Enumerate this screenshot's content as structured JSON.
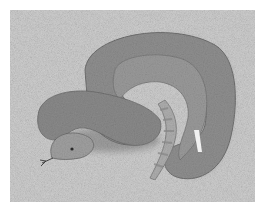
{
  "image": {
    "subject": "coiled snake on sand",
    "style": "grayscale photograph",
    "colors": {
      "border": "#ffffff",
      "sand": "#c9c9c9",
      "snake_body": "#8d8d8d",
      "snake_shadow": "#5e5e5e",
      "tail_band": "#a8a8a8"
    }
  }
}
